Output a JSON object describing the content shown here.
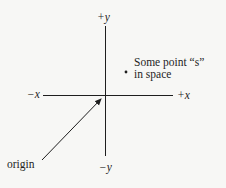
{
  "diagram": {
    "type": "coordinate-axes",
    "axes": {
      "x_positive_label": "+x",
      "x_negative_label": "−x",
      "y_positive_label": "+y",
      "y_negative_label": "−y"
    },
    "point": {
      "label_line1": "Some point “s”",
      "label_line2": "in space"
    },
    "origin": {
      "label": "origin"
    },
    "colors": {
      "ink": "#1e1e1e",
      "background": "#f7f7f5"
    }
  }
}
